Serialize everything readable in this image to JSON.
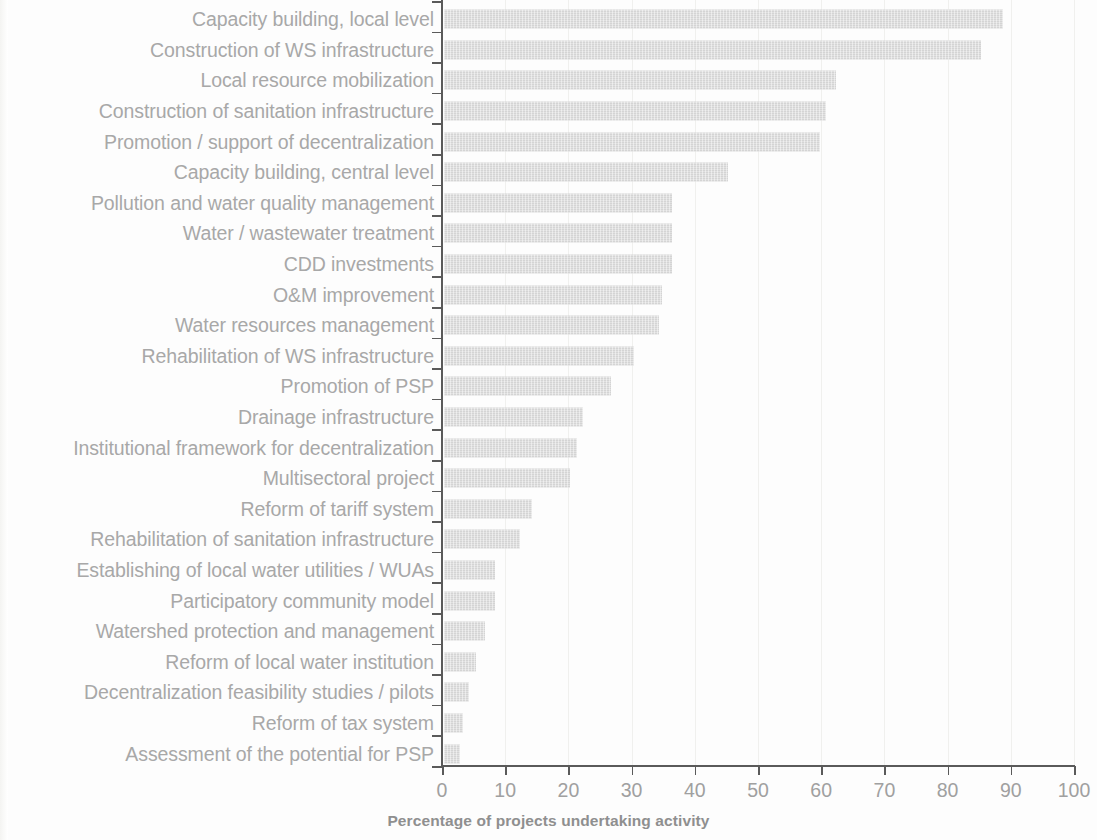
{
  "chart_data": {
    "type": "bar",
    "orientation": "horizontal",
    "title": "",
    "xlabel": "Percentage of projects undertaking activity",
    "ylabel": "",
    "xlim": [
      0,
      100
    ],
    "xticks": [
      0,
      10,
      20,
      30,
      40,
      50,
      60,
      70,
      80,
      90,
      100
    ],
    "xtick_labels": [
      "0",
      "10",
      "20",
      "30",
      "40",
      "50",
      "60",
      "70",
      "80",
      "90",
      "100"
    ],
    "grid": "vertical-light",
    "legend": "none",
    "bar_color": "#d4d4d4",
    "categories": [
      "Capacity building, local level",
      "Construction of WS infrastructure",
      "Local resource mobilization",
      "Construction of sanitation infrastructure",
      "Promotion / support of decentralization",
      "Capacity building, central level",
      "Pollution and water quality management",
      "Water / wastewater treatment",
      "CDD investments",
      "O&M improvement",
      "Water resources management",
      "Rehabilitation of WS infrastructure",
      "Promotion of PSP",
      "Drainage infrastructure",
      "Institutional framework for decentralization",
      "Multisectoral project",
      "Reform of tariff system",
      "Rehabilitation of sanitation infrastructure",
      "Establishing of local water utilities / WUAs",
      "Participatory community model",
      "Watershed protection and management",
      "Reform of local water institution",
      "Decentralization feasibility studies / pilots",
      "Reform of tax system",
      "Assessment of the potential for PSP"
    ],
    "values": [
      88.5,
      85.0,
      62.0,
      60.5,
      59.5,
      45.0,
      36.0,
      36.0,
      36.0,
      34.5,
      34.0,
      30.0,
      26.5,
      22.0,
      21.0,
      20.0,
      14.0,
      12.0,
      8.0,
      8.0,
      6.5,
      5.0,
      4.0,
      3.0,
      2.5
    ]
  }
}
